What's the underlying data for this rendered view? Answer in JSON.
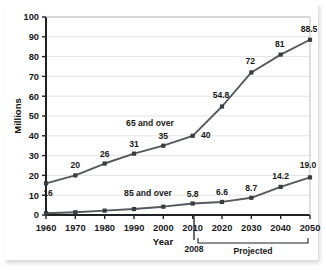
{
  "chart_data": {
    "type": "line",
    "title": "",
    "xlabel": "Year",
    "ylabel": "Millions",
    "x": [
      1960,
      1970,
      1980,
      1990,
      2000,
      2008,
      2020,
      2030,
      2040,
      2050
    ],
    "categories": [
      "1960",
      "1970",
      "1980",
      "1990",
      "2000",
      "2010",
      "2020",
      "2030",
      "2040",
      "2050"
    ],
    "xtick_labels": [
      "1960",
      "1970",
      "1980",
      "1990",
      "2000",
      "2010",
      "2020",
      "2030",
      "2040",
      "2050"
    ],
    "ytick_labels": [
      "0",
      "10",
      "20",
      "30",
      "40",
      "50",
      "60",
      "70",
      "80",
      "90",
      "100"
    ],
    "xlim": [
      1960,
      2050
    ],
    "ylim": [
      0,
      100
    ],
    "ystep": 10,
    "grid": "horizontal",
    "legend": "inline-series-labels",
    "series": [
      {
        "name": "65 and over",
        "label": "65 and over",
        "values": [
          16,
          20,
          26,
          31,
          35,
          40,
          54.8,
          72,
          81,
          88.5
        ],
        "point_labels": [
          "16",
          "20",
          "26",
          "31",
          "35",
          "40",
          "54.8",
          "72",
          "81",
          "88.5"
        ],
        "color": "#55585c"
      },
      {
        "name": "85 and over",
        "label": "85 and over",
        "values": [
          0.9,
          1.4,
          2.2,
          3.0,
          4.2,
          5.8,
          6.6,
          8.7,
          14.2,
          19.0
        ],
        "point_labels": [
          "",
          "",
          "",
          "",
          "",
          "5.8",
          "6.6",
          "8.7",
          "14.2",
          "19.0"
        ],
        "color": "#55585c"
      }
    ],
    "annotations": [
      {
        "name": "projection-divider-year",
        "text": "2008"
      },
      {
        "name": "projected-bracket",
        "text": "Projected"
      }
    ]
  },
  "axes": {
    "y_title": "Millions",
    "x_title": "Year"
  },
  "colors": {
    "line": "#55585c",
    "marker": "#3a3d40",
    "grid": "#dcdcdc",
    "axis": "#1f2124",
    "text": "#1a1a1a",
    "background": "#ffffff"
  }
}
